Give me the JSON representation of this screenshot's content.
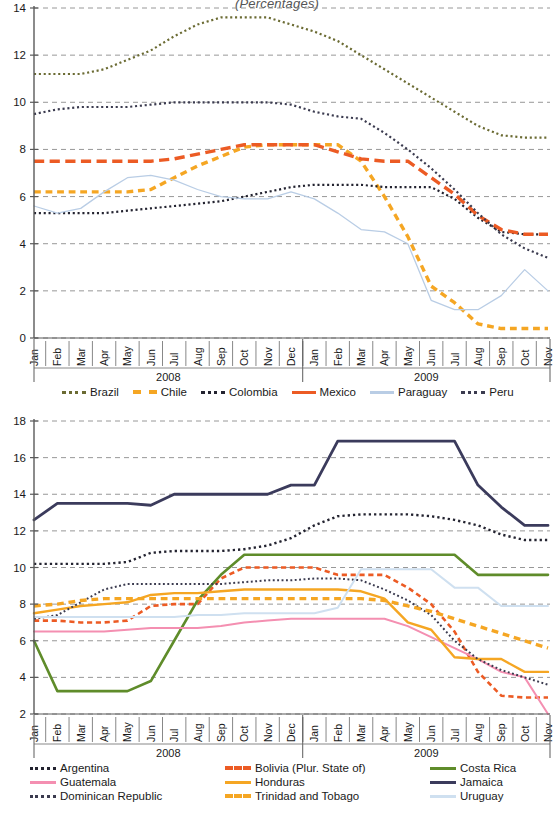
{
  "title": "(Percentages)",
  "axis": {
    "months": [
      "Jan",
      "Feb",
      "Mar",
      "Apr",
      "May",
      "Jun",
      "Jul",
      "Aug",
      "Sep",
      "Oct",
      "Nov",
      "Dec",
      "Jan",
      "Feb",
      "Mar",
      "Apr",
      "May",
      "Jun",
      "Jul",
      "Aug",
      "Sep",
      "Oct",
      "Nov"
    ],
    "year_left": "2008",
    "year_right": "2009"
  },
  "colors": {
    "brazil": "#6b6b33",
    "chile": "#f5a623",
    "colombia": "#232330",
    "mexico": "#ec5b24",
    "paraguay": "#b9cde5",
    "peru": "#3b3b4f",
    "argentina": "#232330",
    "bolivia": "#ec5b24",
    "costa_rica": "#5f8c2a",
    "guatemala": "#f48fb1",
    "honduras": "#f5a623",
    "jamaica": "#3b3b5c",
    "dominican_republic": "#3b3b4f",
    "trinidad_and_tobago": "#f5a623",
    "uruguay": "#cfe0f0",
    "grid": "#8c8c8c",
    "axis": "#5a5a5a"
  },
  "chart_data": [
    {
      "type": "line",
      "title": "(Percentages)",
      "xlabel": "",
      "ylabel": "",
      "ylim": [
        0,
        14
      ],
      "yticks": [
        0,
        2,
        4,
        6,
        8,
        10,
        12,
        14
      ],
      "grid": true,
      "legend_position": "below",
      "x": [
        "Jan 2008",
        "Feb 2008",
        "Mar 2008",
        "Apr 2008",
        "May 2008",
        "Jun 2008",
        "Jul 2008",
        "Aug 2008",
        "Sep 2008",
        "Oct 2008",
        "Nov 2008",
        "Dec 2008",
        "Jan 2009",
        "Feb 2009",
        "Mar 2009",
        "Apr 2009",
        "May 2009",
        "Jun 2009",
        "Jul 2009",
        "Aug 2009",
        "Sep 2009",
        "Oct 2009",
        "Nov 2009"
      ],
      "series": [
        {
          "name": "Brazil",
          "style": "dotted",
          "width": 2.2,
          "values": [
            11.2,
            11.2,
            11.2,
            11.4,
            11.8,
            12.2,
            12.8,
            13.3,
            13.6,
            13.6,
            13.6,
            13.3,
            13.0,
            12.6,
            12.0,
            11.4,
            10.8,
            10.2,
            9.6,
            9.0,
            8.6,
            8.5,
            8.5
          ]
        },
        {
          "name": "Chile",
          "style": "dashed",
          "width": 3.4,
          "values": [
            6.2,
            6.2,
            6.2,
            6.2,
            6.2,
            6.3,
            6.8,
            7.3,
            7.7,
            8.1,
            8.2,
            8.2,
            8.2,
            8.2,
            7.5,
            6.0,
            4.3,
            2.2,
            1.5,
            0.6,
            0.4,
            0.4,
            0.4
          ]
        },
        {
          "name": "Colombia",
          "style": "dotted",
          "width": 2.2,
          "values": [
            5.3,
            5.3,
            5.3,
            5.3,
            5.4,
            5.5,
            5.6,
            5.7,
            5.8,
            6.0,
            6.2,
            6.4,
            6.5,
            6.5,
            6.5,
            6.4,
            6.4,
            6.4,
            5.9,
            5.1,
            4.5,
            4.4,
            4.4
          ]
        },
        {
          "name": "Mexico",
          "style": "dashed-long",
          "width": 3.4,
          "values": [
            7.5,
            7.5,
            7.5,
            7.5,
            7.5,
            7.5,
            7.6,
            7.8,
            8.0,
            8.2,
            8.2,
            8.2,
            8.2,
            7.9,
            7.6,
            7.5,
            7.5,
            6.8,
            6.1,
            5.2,
            4.6,
            4.4,
            4.4
          ]
        },
        {
          "name": "Paraguay",
          "style": "solid",
          "width": 1.3,
          "values": [
            5.6,
            5.3,
            5.5,
            6.2,
            6.8,
            6.9,
            6.7,
            6.3,
            6.0,
            5.9,
            5.9,
            6.2,
            5.9,
            5.3,
            4.6,
            4.5,
            4.0,
            1.6,
            1.2,
            1.2,
            1.8,
            2.9,
            2.0
          ]
        },
        {
          "name": "Peru",
          "style": "dotted",
          "width": 2.2,
          "values": [
            9.5,
            9.7,
            9.8,
            9.8,
            9.8,
            9.9,
            10.0,
            10.0,
            10.0,
            10.0,
            10.0,
            9.9,
            9.6,
            9.4,
            9.3,
            8.7,
            8.0,
            7.2,
            6.3,
            5.3,
            4.4,
            3.8,
            3.4
          ]
        }
      ]
    },
    {
      "type": "line",
      "title": "",
      "xlabel": "",
      "ylabel": "",
      "ylim": [
        2,
        18
      ],
      "yticks": [
        2,
        4,
        6,
        8,
        10,
        12,
        14,
        16,
        18
      ],
      "grid": true,
      "legend_position": "below",
      "x": [
        "Jan 2008",
        "Feb 2008",
        "Mar 2008",
        "Apr 2008",
        "May 2008",
        "Jun 2008",
        "Jul 2008",
        "Aug 2008",
        "Sep 2008",
        "Oct 2008",
        "Nov 2008",
        "Dec 2008",
        "Jan 2009",
        "Feb 2009",
        "Mar 2009",
        "Apr 2009",
        "May 2009",
        "Jun 2009",
        "Jul 2009",
        "Aug 2009",
        "Sep 2009",
        "Oct 2009",
        "Nov 2009"
      ],
      "series": [
        {
          "name": "Argentina",
          "style": "dotted",
          "width": 2.4,
          "values": [
            10.2,
            10.2,
            10.2,
            10.2,
            10.3,
            10.8,
            10.9,
            10.9,
            10.9,
            11.0,
            11.2,
            11.6,
            12.3,
            12.8,
            12.9,
            12.9,
            12.9,
            12.8,
            12.6,
            12.3,
            11.8,
            11.5,
            11.5
          ]
        },
        {
          "name": "Bolivia (Plur. State of)",
          "style": "dashed",
          "width": 2.6,
          "values": [
            7.1,
            7.1,
            7.0,
            7.0,
            7.1,
            7.9,
            8.0,
            8.0,
            9.4,
            10.0,
            10.0,
            10.0,
            10.0,
            9.6,
            9.6,
            9.6,
            8.9,
            8.0,
            6.5,
            4.3,
            3.0,
            2.9,
            2.9
          ]
        },
        {
          "name": "Costa Rica",
          "style": "solid",
          "width": 2.6,
          "values": [
            6.0,
            3.25,
            3.25,
            3.25,
            3.25,
            3.8,
            6.0,
            8.2,
            9.6,
            10.7,
            10.7,
            10.7,
            10.7,
            10.7,
            10.7,
            10.7,
            10.7,
            10.7,
            10.7,
            9.6,
            9.6,
            9.6,
            9.6
          ]
        },
        {
          "name": "Guatemala",
          "style": "solid",
          "width": 2.0,
          "values": [
            6.5,
            6.5,
            6.5,
            6.5,
            6.6,
            6.7,
            6.7,
            6.7,
            6.8,
            7.0,
            7.1,
            7.2,
            7.2,
            7.2,
            7.2,
            7.2,
            6.8,
            6.2,
            5.6,
            5.0,
            4.3,
            4.0,
            2.0
          ]
        },
        {
          "name": "Honduras",
          "style": "solid",
          "width": 2.4,
          "values": [
            7.5,
            7.7,
            7.9,
            8.0,
            8.1,
            8.5,
            8.6,
            8.6,
            8.7,
            8.8,
            8.8,
            8.8,
            8.8,
            8.8,
            8.7,
            8.3,
            7.0,
            6.6,
            5.1,
            5.0,
            5.0,
            4.3,
            4.3
          ]
        },
        {
          "name": "Jamaica",
          "style": "solid",
          "width": 2.8,
          "values": [
            12.6,
            13.5,
            13.5,
            13.5,
            13.5,
            13.4,
            14.0,
            14.0,
            14.0,
            14.0,
            14.0,
            14.5,
            14.5,
            16.9,
            16.9,
            16.9,
            16.9,
            16.9,
            16.9,
            14.5,
            13.3,
            12.3,
            12.3
          ]
        },
        {
          "name": "Dominican Republic",
          "style": "dotted",
          "width": 2.0,
          "values": [
            7.2,
            7.4,
            8.1,
            8.8,
            9.1,
            9.1,
            9.1,
            9.1,
            9.1,
            9.2,
            9.3,
            9.3,
            9.4,
            9.4,
            9.3,
            8.8,
            8.2,
            7.4,
            6.0,
            5.0,
            4.4,
            4.0,
            3.6
          ]
        },
        {
          "name": "Trinidad and Tobago",
          "style": "dashed",
          "width": 3.4,
          "values": [
            7.9,
            8.0,
            8.2,
            8.3,
            8.3,
            8.3,
            8.3,
            8.3,
            8.3,
            8.3,
            8.3,
            8.3,
            8.3,
            8.3,
            8.3,
            8.2,
            7.9,
            7.6,
            7.2,
            6.8,
            6.4,
            6.0,
            5.6
          ]
        },
        {
          "name": "Uruguay",
          "style": "solid",
          "width": 2.0,
          "values": [
            7.3,
            7.3,
            7.3,
            7.3,
            7.3,
            7.3,
            7.3,
            7.4,
            7.4,
            7.5,
            7.5,
            7.5,
            7.5,
            7.8,
            9.9,
            9.9,
            9.9,
            9.9,
            8.9,
            8.9,
            7.9,
            7.9,
            7.9
          ]
        }
      ]
    }
  ],
  "legend1": [
    {
      "label": "Brazil",
      "color": "#6b6b33",
      "style": "dotted"
    },
    {
      "label": "Chile",
      "color": "#f5a623",
      "style": "dashed"
    },
    {
      "label": "Colombia",
      "color": "#232330",
      "style": "dotted"
    },
    {
      "label": "Mexico",
      "color": "#ec5b24",
      "style": "solid"
    },
    {
      "label": "Paraguay",
      "color": "#b9cde5",
      "style": "solid"
    },
    {
      "label": "Peru",
      "color": "#3b3b4f",
      "style": "dotted"
    }
  ],
  "legend2": [
    {
      "label": "Argentina",
      "color": "#232330",
      "style": "dotted"
    },
    {
      "label": "Bolivia (Plur. State of)",
      "color": "#ec5b24",
      "style": "dashed"
    },
    {
      "label": "Costa Rica",
      "color": "#5f8c2a",
      "style": "solid"
    },
    {
      "label": "Guatemala",
      "color": "#f48fb1",
      "style": "solid"
    },
    {
      "label": "Honduras",
      "color": "#f5a623",
      "style": "solid"
    },
    {
      "label": "Jamaica",
      "color": "#3b3b5c",
      "style": "solid"
    },
    {
      "label": "Dominican Republic",
      "color": "#3b3b4f",
      "style": "dotted"
    },
    {
      "label": "Trinidad and Tobago",
      "color": "#f5a623",
      "style": "dashed"
    },
    {
      "label": "Uruguay",
      "color": "#cfe0f0",
      "style": "solid"
    }
  ]
}
